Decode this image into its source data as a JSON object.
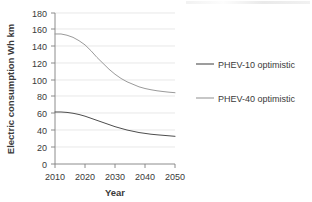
{
  "chart_data": {
    "type": "line",
    "title": "",
    "xlabel": "Year",
    "ylabel": "Electric consumption Wh km",
    "x": [
      2010,
      2012,
      2014,
      2016,
      2018,
      2020,
      2022,
      2024,
      2026,
      2028,
      2030,
      2032,
      2034,
      2036,
      2038,
      2040,
      2042,
      2044,
      2046,
      2048,
      2050
    ],
    "xlim": [
      2010,
      2050
    ],
    "ylim": [
      0,
      180
    ],
    "xticks": [
      2010,
      2020,
      2030,
      2040,
      2050
    ],
    "yticks": [
      0,
      20,
      40,
      60,
      80,
      100,
      120,
      140,
      160,
      180
    ],
    "xtick_labels": [
      "2010",
      "2020",
      "2030",
      "2040",
      "2050"
    ],
    "ytick_labels": [
      "0",
      "20",
      "40",
      "60",
      "80",
      "100",
      "120",
      "140",
      "160",
      "180"
    ],
    "grid": "horizontal",
    "legend_position": "right",
    "series": [
      {
        "name": "PHEV-10 optimistic",
        "color": "#4d4d4d",
        "values": [
          62,
          62,
          61.5,
          60.5,
          59,
          57,
          54.5,
          52,
          49.5,
          47,
          44.5,
          42.5,
          40.5,
          39,
          37.5,
          36.5,
          35.5,
          34.8,
          34.2,
          33.6,
          33
        ]
      },
      {
        "name": "PHEV-40 optimistic",
        "color": "#9a9a9a",
        "values": [
          155,
          155,
          153.5,
          151,
          147,
          142,
          135,
          127,
          120,
          113,
          107,
          102,
          98,
          95,
          92,
          90,
          88.5,
          87.3,
          86.4,
          85.6,
          85
        ]
      }
    ]
  },
  "legend": {
    "items": [
      {
        "label": "PHEV-10 optimistic",
        "color": "#4d4d4d"
      },
      {
        "label": "PHEV-40 optimistic",
        "color": "#9a9a9a"
      }
    ]
  },
  "axes": {
    "x_title": "Year",
    "y_title": "Electric consumption Wh km"
  }
}
